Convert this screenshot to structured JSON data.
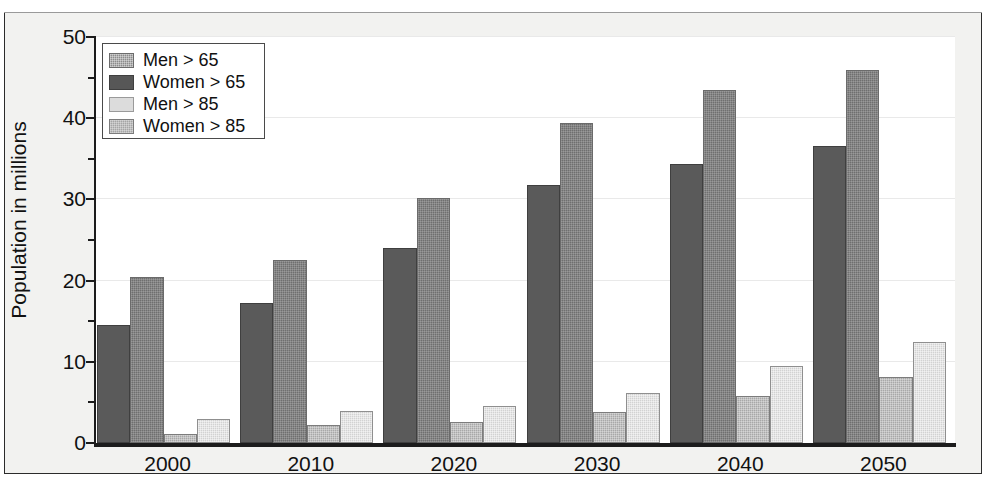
{
  "chart_data": {
    "type": "bar",
    "title": "",
    "subtitle": "",
    "xlabel": "",
    "ylabel": "Population in millions",
    "categories": [
      "2000",
      "2010",
      "2020",
      "2030",
      "2040",
      "2050"
    ],
    "series": [
      {
        "name": "Men > 65",
        "color": "#6f6f6f",
        "values": [
          20.4,
          22.5,
          30.2,
          39.4,
          43.5,
          45.9
        ]
      },
      {
        "name": "Women > 65",
        "color": "#5a5a5a",
        "values": [
          14.5,
          17.2,
          24.0,
          31.8,
          34.3,
          36.6
        ]
      },
      {
        "name": "Men > 85",
        "color": "#d2d2d2",
        "values": [
          3.0,
          3.9,
          4.6,
          6.1,
          9.5,
          12.4
        ]
      },
      {
        "name": "Women > 85",
        "color": "#a8a8a8",
        "values": [
          1.1,
          2.2,
          2.6,
          3.8,
          5.8,
          8.1
        ]
      }
    ],
    "bar_series_order": [
      1,
      0,
      3,
      2
    ],
    "ylim": [
      0,
      50
    ],
    "yticks": [
      0,
      10,
      20,
      30,
      40,
      50
    ],
    "yminorticks": [
      5,
      15,
      25,
      35,
      45
    ],
    "ytick_labels": [
      "0",
      "10",
      "20",
      "30",
      "40",
      "50"
    ],
    "grid": true,
    "grid_axis": "y",
    "legend_position": "top-left",
    "legend_entries": [
      "Men > 65",
      "Women > 65",
      "Men > 85",
      "Women > 85"
    ]
  },
  "axis": {
    "y_title": "Population in millions"
  }
}
